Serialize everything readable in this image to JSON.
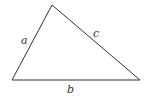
{
  "diagram": {
    "type": "triangle",
    "vertices": {
      "left": [
        12,
        80
      ],
      "top": [
        52,
        5
      ],
      "right": [
        140,
        80
      ]
    },
    "sides": [
      {
        "name": "a",
        "label": "a",
        "from": "left",
        "to": "top"
      },
      {
        "name": "b",
        "label": "b",
        "from": "left",
        "to": "right"
      },
      {
        "name": "c",
        "label": "c",
        "from": "top",
        "to": "right"
      }
    ],
    "stroke_color": "#333333",
    "background": "#ffffff"
  }
}
